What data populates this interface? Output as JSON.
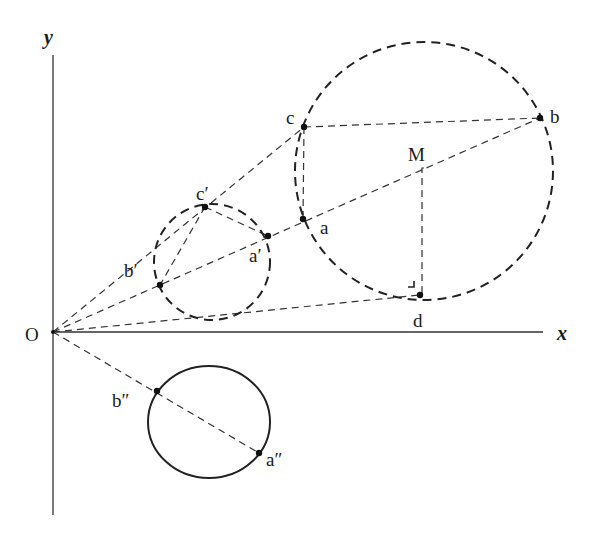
{
  "diagram": {
    "type": "geometric-construction",
    "axes": {
      "x_label": "x",
      "y_label": "y",
      "origin_label": "O"
    },
    "points": {
      "a": "a",
      "b": "b",
      "c": "c",
      "d": "d",
      "M": "M",
      "a_prime": "a′",
      "b_prime": "b′",
      "c_prime": "c′",
      "a_dprime": "a″",
      "b_dprime": "b″"
    },
    "circles": [
      {
        "name": "large-circle",
        "style": "dashed",
        "through": [
          "a",
          "b",
          "c",
          "d"
        ],
        "center": "M"
      },
      {
        "name": "small-circle",
        "style": "dashed",
        "through": [
          "a′",
          "b′",
          "c′"
        ]
      },
      {
        "name": "lower-circle",
        "style": "solid",
        "through": [
          "a″",
          "b″"
        ]
      }
    ],
    "lines": [
      "O–c (through c′)",
      "O–b (through b′, a′, a, M)",
      "O–d",
      "O–a″ (through b″)",
      "c–b",
      "c–a",
      "c′–a′",
      "c′–b′",
      "M–d (perpendicular)"
    ]
  }
}
